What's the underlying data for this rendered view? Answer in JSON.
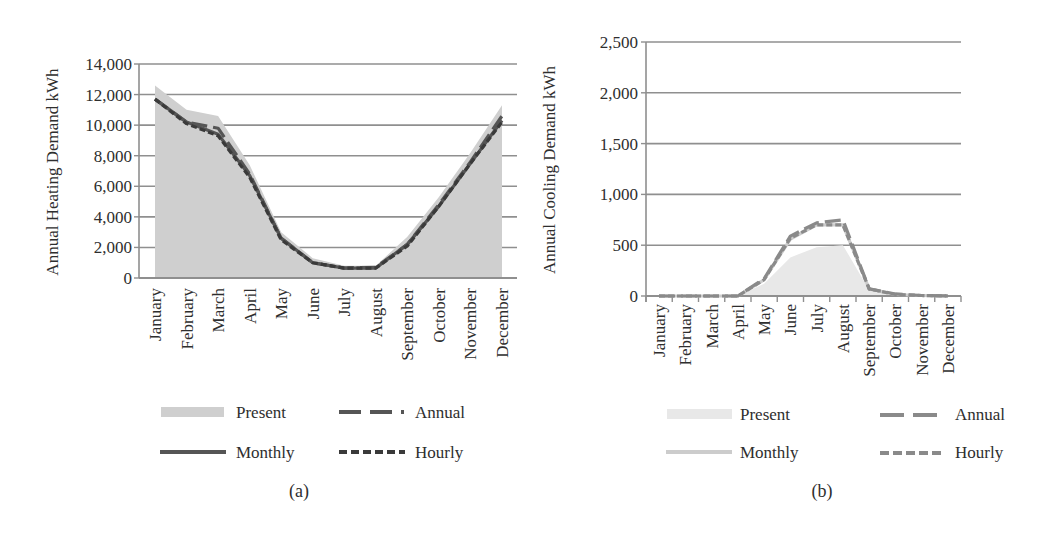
{
  "chart_data": [
    {
      "id": "a",
      "type": "area+line",
      "panel_label": "(a)",
      "title": "",
      "xlabel": "",
      "ylabel": "Annual Heating Demand kWh",
      "ylim": [
        0,
        14000
      ],
      "yticks": [
        0,
        2000,
        4000,
        6000,
        8000,
        10000,
        12000,
        14000
      ],
      "ytick_labels": [
        "0",
        "2,000",
        "4,000",
        "6,000",
        "8,000",
        "10,000",
        "12,000",
        "14,000"
      ],
      "grid": true,
      "legend_position": "bottom",
      "categories": [
        "January",
        "February",
        "March",
        "April",
        "May",
        "June",
        "July",
        "August",
        "September",
        "October",
        "November",
        "December"
      ],
      "series": [
        {
          "name": "Present",
          "style": "area",
          "color": "#cfcfcf",
          "values": [
            12600,
            11000,
            10600,
            7400,
            3000,
            1300,
            800,
            800,
            2700,
            5300,
            8200,
            11300
          ]
        },
        {
          "name": "Monthly",
          "style": "solid",
          "color": "#555555",
          "values": [
            11700,
            10200,
            9400,
            6700,
            2600,
            1000,
            650,
            650,
            2200,
            4700,
            7500,
            10300
          ]
        },
        {
          "name": "Annual",
          "style": "long-dash",
          "color": "#555555",
          "values": [
            11700,
            10200,
            9800,
            6800,
            2600,
            1000,
            650,
            700,
            2200,
            4800,
            7600,
            10600
          ]
        },
        {
          "name": "Hourly",
          "style": "short-dash",
          "color": "#3a3a3a",
          "values": [
            11700,
            10100,
            9300,
            6600,
            2500,
            1000,
            650,
            650,
            2100,
            4700,
            7500,
            10200
          ]
        }
      ]
    },
    {
      "id": "b",
      "type": "area+line",
      "panel_label": "(b)",
      "title": "",
      "xlabel": "",
      "ylabel": "Annual Cooling Demand kWh",
      "ylim": [
        0,
        2500
      ],
      "yticks": [
        0,
        500,
        1000,
        1500,
        2000,
        2500
      ],
      "ytick_labels": [
        "0",
        "500",
        "1,000",
        "1,500",
        "2,000",
        "2,500"
      ],
      "grid": true,
      "legend_position": "bottom",
      "categories": [
        "January",
        "February",
        "March",
        "April",
        "May",
        "June",
        "July",
        "August",
        "September",
        "October",
        "November",
        "December"
      ],
      "series": [
        {
          "name": "Present",
          "style": "area",
          "color": "#e8e8e8",
          "values": [
            0,
            0,
            0,
            0,
            120,
            380,
            480,
            500,
            60,
            10,
            0,
            0
          ]
        },
        {
          "name": "Monthly",
          "style": "solid",
          "color": "#cccccc",
          "values": [
            0,
            0,
            0,
            0,
            160,
            560,
            700,
            700,
            70,
            15,
            5,
            0
          ]
        },
        {
          "name": "Annual",
          "style": "long-dash",
          "color": "#8a8a8a",
          "values": [
            0,
            0,
            0,
            0,
            170,
            590,
            720,
            750,
            70,
            20,
            5,
            0
          ]
        },
        {
          "name": "Hourly",
          "style": "short-dash",
          "color": "#8a8a8a",
          "values": [
            0,
            0,
            0,
            0,
            160,
            570,
            700,
            700,
            70,
            15,
            5,
            0
          ]
        }
      ]
    }
  ],
  "legend": {
    "present": "Present",
    "annual": "Annual",
    "monthly": "Monthly",
    "hourly": "Hourly"
  },
  "panels": {
    "a_label": "(a)",
    "b_label": "(b)"
  }
}
